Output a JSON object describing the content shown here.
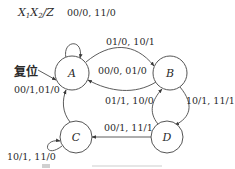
{
  "diagram": {
    "type": "state-transition-diagram",
    "header": {
      "x1": "X",
      "x1_sub": "1",
      "x2": "X",
      "x2_sub": "2",
      "rest": "/Z"
    },
    "reset_label": "复位",
    "states": [
      {
        "id": "A",
        "label": "A"
      },
      {
        "id": "B",
        "label": "B"
      },
      {
        "id": "C",
        "label": "C"
      },
      {
        "id": "D",
        "label": "D"
      }
    ],
    "transitions": [
      {
        "from": "A",
        "to": "A",
        "label": "00/0, 11/0"
      },
      {
        "from": "A",
        "to": "B",
        "label": "01/0, 10/1"
      },
      {
        "from": "B",
        "to": "A",
        "label": "00/0, 01/0"
      },
      {
        "from": "B",
        "to": "D",
        "label": "10/1, 11/1"
      },
      {
        "from": "D",
        "to": "B",
        "label": "01/1, 10/0"
      },
      {
        "from": "D",
        "to": "C",
        "label": "00/1, 11/1"
      },
      {
        "from": "C",
        "to": "A",
        "label": "00/1,01/0"
      },
      {
        "from": "C",
        "to": "C",
        "label": "10/1, 11/0"
      }
    ],
    "colors": {
      "stroke": "#4a4a4a",
      "text": "#2a2a2a",
      "background": "#ffffff"
    }
  }
}
